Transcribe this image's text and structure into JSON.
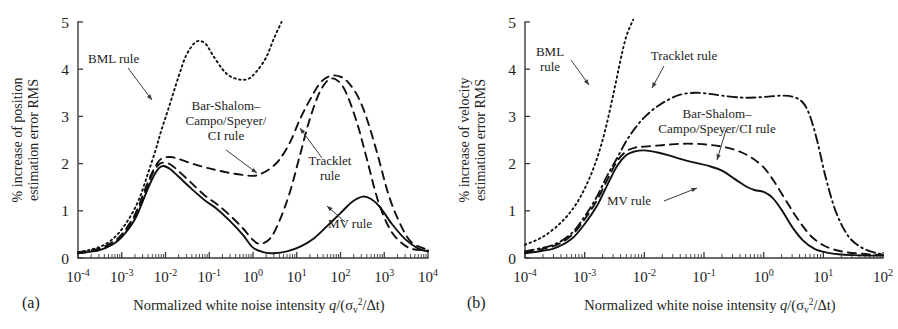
{
  "figure": {
    "background": "#ffffff",
    "ink": "#111111",
    "panels": [
      {
        "letter": "(a)",
        "ylabel_line1": "% increase of position",
        "ylabel_line2": "estimation error RMS",
        "xlabel_prefix": "Normalized white noise intensity ",
        "xlabel_math_q": "q",
        "xlabel_math_rest": "/(σ",
        "xlabel_math_sub": "v",
        "xlabel_math_sup": "2",
        "xlabel_math_tail": "/Δt)",
        "annotations": [
          {
            "name": "bml-rule-label",
            "lines": [
              "BML rule"
            ],
            "x": 88,
            "y": 63,
            "anchor": "start",
            "leader": [
              [
                128,
                68
              ],
              [
                152,
                100
              ]
            ]
          },
          {
            "name": "bar-shalom-label",
            "lines": [
              "Bar-Shalom–",
              "Campo/Speyer/",
              "CI rule"
            ],
            "x": 226,
            "y": 110,
            "anchor": "middle",
            "leader": [
              [
                226,
                150
              ],
              [
                257,
                173
              ]
            ]
          },
          {
            "name": "tracklet-rule-label",
            "lines": [
              "Tracklet",
              "rule"
            ],
            "x": 330,
            "y": 165,
            "anchor": "middle",
            "leader": [
              [
                322,
                158
              ],
              [
                300,
                128
              ]
            ]
          },
          {
            "name": "mv-rule-label",
            "lines": [
              "MV rule"
            ],
            "x": 350,
            "y": 228,
            "anchor": "middle",
            "leader": [
              [
                345,
                222
              ],
              [
                327,
                206
              ]
            ]
          }
        ]
      },
      {
        "letter": "(b)",
        "ylabel_line1": "% increase of velocity",
        "ylabel_line2": "estimation error RMS",
        "xlabel_prefix": "Normalized white noise intensity ",
        "xlabel_math_q": "q",
        "xlabel_math_rest": "/(σ",
        "xlabel_math_sub": "v",
        "xlabel_math_sup": "2",
        "xlabel_math_tail": "/Δt)",
        "annotations": [
          {
            "name": "bml-rule-label",
            "lines": [
              "BML",
              "rule"
            ],
            "x": 101,
            "y": 56,
            "anchor": "middle",
            "leader": [
              [
                122,
                60
              ],
              [
                140,
                85
              ]
            ]
          },
          {
            "name": "tracklet-rule-label",
            "lines": [
              "Tracklet rule"
            ],
            "x": 235,
            "y": 60,
            "anchor": "middle",
            "leader": [
              [
                215,
                66
              ],
              [
                203,
                88
              ]
            ]
          },
          {
            "name": "bar-shalom-label",
            "lines": [
              "Bar-Shalom–",
              "Campo/Speyer/CI rule"
            ],
            "x": 268,
            "y": 118,
            "anchor": "middle",
            "leader": [
              [
                277,
                130
              ],
              [
                268,
                160
              ]
            ]
          },
          {
            "name": "mv-rule-label",
            "lines": [
              "MV rule"
            ],
            "x": 180,
            "y": 205,
            "anchor": "middle",
            "leader": [
              [
                215,
                201
              ],
              [
                248,
                188
              ]
            ]
          }
        ]
      }
    ]
  },
  "chart_data": [
    {
      "id": "panel-a",
      "type": "line",
      "title": "",
      "panel_label": "(a)",
      "xlabel": "Normalized white noise intensity q/(σv²/Δt)",
      "ylabel": "% increase of position estimation error RMS",
      "xscale": "log",
      "xlim": [
        0.0001,
        10000.0
      ],
      "ylim": [
        0,
        5
      ],
      "xticks": [
        0.0001,
        0.001,
        0.01,
        0.1,
        1,
        10,
        100,
        1000,
        10000
      ],
      "xticklabels": [
        "10-4",
        "10-3",
        "10-2",
        "10-1",
        "100",
        "101",
        "102",
        "103",
        "104"
      ],
      "yticks": [
        0,
        1,
        2,
        3,
        4,
        5
      ],
      "yticklabels": [
        "0",
        "1",
        "2",
        "3",
        "4",
        "5"
      ],
      "grid": false,
      "legend_position": "inline-annotations",
      "series": [
        {
          "name": "BML rule",
          "style": "dotted",
          "x": [
            0.0001,
            0.0002,
            0.0004,
            0.0008,
            0.0015,
            0.0025,
            0.004,
            0.006,
            0.008,
            0.012,
            0.02,
            0.03,
            0.05,
            0.08,
            0.12,
            0.2,
            0.3,
            0.5,
            0.8,
            1.2,
            2,
            3,
            4.5
          ],
          "values": [
            0.12,
            0.18,
            0.28,
            0.5,
            0.85,
            1.25,
            1.8,
            2.3,
            2.7,
            3.2,
            3.85,
            4.3,
            4.58,
            4.55,
            4.3,
            4.0,
            3.85,
            3.78,
            3.8,
            3.95,
            4.25,
            4.65,
            5.0
          ]
        },
        {
          "name": "Bar-Shalom–Campo/Speyer/CI rule",
          "style": "dashed",
          "x": [
            0.0001,
            0.0003,
            0.0006,
            0.001,
            0.002,
            0.0035,
            0.005,
            0.007,
            0.009,
            0.013,
            0.02,
            0.04,
            0.08,
            0.15,
            0.3,
            0.6,
            1.0,
            1.5,
            2.5,
            4,
            7,
            12,
            20,
            35,
            60,
            100,
            150,
            250,
            400,
            700,
            1200,
            2000,
            4000,
            10000.0
          ],
          "values": [
            0.12,
            0.2,
            0.33,
            0.5,
            0.92,
            1.48,
            1.82,
            2.05,
            2.12,
            2.14,
            2.1,
            2.0,
            1.92,
            1.86,
            1.8,
            1.76,
            1.74,
            1.78,
            1.9,
            2.08,
            2.45,
            2.95,
            3.35,
            3.72,
            3.86,
            3.84,
            3.72,
            3.42,
            2.95,
            2.2,
            1.4,
            0.85,
            0.35,
            0.17
          ]
        },
        {
          "name": "Tracklet rule",
          "style": "dashed",
          "x": [
            0.0001,
            0.0003,
            0.0006,
            0.001,
            0.002,
            0.0035,
            0.005,
            0.007,
            0.009,
            0.013,
            0.02,
            0.04,
            0.08,
            0.15,
            0.3,
            0.6,
            1.0,
            1.5,
            2.5,
            4,
            7,
            12,
            20,
            35,
            60,
            100,
            150,
            250,
            400,
            700,
            1200,
            2000,
            4000,
            10000.0
          ],
          "values": [
            0.1,
            0.17,
            0.3,
            0.47,
            0.88,
            1.42,
            1.78,
            1.98,
            2.02,
            1.98,
            1.84,
            1.58,
            1.32,
            1.14,
            0.9,
            0.62,
            0.38,
            0.3,
            0.42,
            0.78,
            1.4,
            2.2,
            2.95,
            3.55,
            3.8,
            3.7,
            3.4,
            2.8,
            2.1,
            1.25,
            0.7,
            0.4,
            0.2,
            0.16
          ]
        },
        {
          "name": "MV rule",
          "style": "solid",
          "x": [
            0.0001,
            0.0003,
            0.0006,
            0.001,
            0.002,
            0.0035,
            0.005,
            0.007,
            0.009,
            0.013,
            0.02,
            0.04,
            0.08,
            0.15,
            0.3,
            0.6,
            1.0,
            1.8,
            3,
            6,
            12,
            25,
            50,
            100,
            180,
            320,
            500,
            800,
            1500,
            3000,
            6000,
            10000.0
          ],
          "values": [
            0.1,
            0.16,
            0.28,
            0.44,
            0.82,
            1.35,
            1.68,
            1.9,
            1.95,
            1.88,
            1.72,
            1.46,
            1.22,
            1.04,
            0.78,
            0.48,
            0.22,
            0.12,
            0.1,
            0.14,
            0.24,
            0.42,
            0.68,
            0.95,
            1.18,
            1.3,
            1.25,
            1.08,
            0.72,
            0.4,
            0.2,
            0.14
          ]
        }
      ]
    },
    {
      "id": "panel-b",
      "type": "line",
      "title": "",
      "panel_label": "(b)",
      "xlabel": "Normalized white noise intensity q/(σv²/Δt)",
      "ylabel": "% increase of velocity estimation error RMS",
      "xscale": "log",
      "xlim": [
        0.0001,
        100.0
      ],
      "ylim": [
        0,
        5
      ],
      "xticks": [
        0.0001,
        0.001,
        0.01,
        0.1,
        1,
        10,
        100
      ],
      "xticklabels": [
        "10-4",
        "10-3",
        "10-2",
        "10-1",
        "100",
        "101",
        "102"
      ],
      "yticks": [
        0,
        1,
        2,
        3,
        4,
        5
      ],
      "yticklabels": [
        "0",
        "1",
        "2",
        "3",
        "4",
        "5"
      ],
      "grid": false,
      "legend_position": "inline-annotations",
      "series": [
        {
          "name": "BML rule",
          "style": "dotted",
          "x": [
            0.0001,
            0.0002,
            0.0004,
            0.0007,
            0.0011,
            0.0016,
            0.0022,
            0.003,
            0.004,
            0.005,
            0.0065
          ],
          "values": [
            0.28,
            0.45,
            0.75,
            1.12,
            1.58,
            2.1,
            2.7,
            3.45,
            4.2,
            4.7,
            5.05
          ]
        },
        {
          "name": "Tracklet rule",
          "style": "dashdot",
          "x": [
            0.0001,
            0.0003,
            0.0006,
            0.001,
            0.0016,
            0.0024,
            0.0035,
            0.005,
            0.007,
            0.01,
            0.016,
            0.025,
            0.04,
            0.07,
            0.12,
            0.2,
            0.4,
            0.7,
            1.2,
            2,
            3,
            4.5,
            6,
            8,
            11,
            16,
            25,
            40,
            70,
            100
          ],
          "values": [
            0.14,
            0.28,
            0.52,
            0.88,
            1.3,
            1.75,
            2.12,
            2.48,
            2.75,
            2.98,
            3.2,
            3.35,
            3.46,
            3.5,
            3.48,
            3.44,
            3.4,
            3.4,
            3.42,
            3.44,
            3.42,
            3.3,
            3.0,
            2.45,
            1.7,
            1.0,
            0.5,
            0.25,
            0.12,
            0.08
          ]
        },
        {
          "name": "Bar-Shalom–Campo/Speyer/CI rule",
          "style": "dashed",
          "x": [
            0.0001,
            0.0003,
            0.0006,
            0.001,
            0.0016,
            0.0024,
            0.0035,
            0.005,
            0.007,
            0.01,
            0.016,
            0.025,
            0.04,
            0.07,
            0.12,
            0.2,
            0.35,
            0.6,
            1.0,
            1.5,
            2.2,
            3.2,
            4.5,
            6.5,
            10,
            16,
            25,
            45,
            70,
            100
          ],
          "values": [
            0.12,
            0.25,
            0.48,
            0.82,
            1.22,
            1.66,
            2.05,
            2.26,
            2.34,
            2.36,
            2.38,
            2.4,
            2.42,
            2.42,
            2.4,
            2.36,
            2.28,
            2.14,
            1.92,
            1.62,
            1.28,
            0.95,
            0.68,
            0.44,
            0.27,
            0.17,
            0.12,
            0.09,
            0.07,
            0.06
          ]
        },
        {
          "name": "MV rule",
          "style": "solid",
          "x": [
            0.0001,
            0.0003,
            0.0006,
            0.001,
            0.0016,
            0.0024,
            0.0035,
            0.005,
            0.007,
            0.01,
            0.016,
            0.025,
            0.04,
            0.07,
            0.12,
            0.2,
            0.35,
            0.5,
            0.7,
            1.0,
            1.4,
            2,
            3,
            4.5,
            7,
            11,
            18,
            30,
            55,
            100
          ],
          "values": [
            0.1,
            0.2,
            0.4,
            0.72,
            1.1,
            1.55,
            1.95,
            2.18,
            2.26,
            2.28,
            2.24,
            2.18,
            2.1,
            2.02,
            1.95,
            1.85,
            1.65,
            1.52,
            1.44,
            1.4,
            1.28,
            1.02,
            0.66,
            0.38,
            0.2,
            0.12,
            0.08,
            0.06,
            0.05,
            0.05
          ]
        }
      ]
    }
  ]
}
